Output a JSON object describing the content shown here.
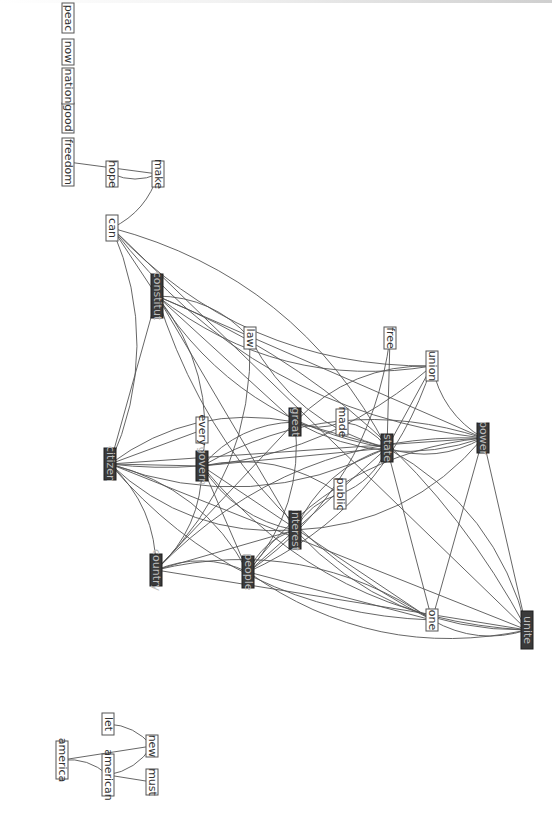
{
  "diagram": {
    "type": "word co-occurrence network",
    "orientation": "rotated-90-clockwise",
    "nodes": [
      {
        "id": "freedom",
        "label": "freedom",
        "style": "light"
      },
      {
        "id": "good",
        "label": "good",
        "style": "light"
      },
      {
        "id": "nation",
        "label": "nation",
        "style": "light"
      },
      {
        "id": "now",
        "label": "now",
        "style": "light"
      },
      {
        "id": "peace",
        "label": "peac",
        "style": "light"
      },
      {
        "id": "hope",
        "label": "hope",
        "style": "light"
      },
      {
        "id": "make",
        "label": "make",
        "style": "light"
      },
      {
        "id": "can",
        "label": "can",
        "style": "light"
      },
      {
        "id": "constitut",
        "label": "constitut",
        "style": "dark"
      },
      {
        "id": "law",
        "label": "law",
        "style": "light"
      },
      {
        "id": "free",
        "label": "free",
        "style": "light"
      },
      {
        "id": "union",
        "label": "union",
        "style": "light"
      },
      {
        "id": "citizen",
        "label": "citizen",
        "style": "dark"
      },
      {
        "id": "every",
        "label": "every",
        "style": "light"
      },
      {
        "id": "govern",
        "label": "govern",
        "style": "dark"
      },
      {
        "id": "great",
        "label": "great",
        "style": "dark"
      },
      {
        "id": "made",
        "label": "made",
        "style": "light"
      },
      {
        "id": "state",
        "label": "state",
        "style": "dark"
      },
      {
        "id": "power",
        "label": "power",
        "style": "dark"
      },
      {
        "id": "public",
        "label": "public",
        "style": "light"
      },
      {
        "id": "interest",
        "label": "interest",
        "style": "dark"
      },
      {
        "id": "country",
        "label": "country",
        "style": "dark"
      },
      {
        "id": "people",
        "label": "people",
        "style": "dark"
      },
      {
        "id": "one",
        "label": "one",
        "style": "light"
      },
      {
        "id": "unite",
        "label": "unite",
        "style": "dark"
      },
      {
        "id": "let",
        "label": "let",
        "style": "light"
      },
      {
        "id": "america",
        "label": "america",
        "style": "light"
      },
      {
        "id": "american",
        "label": "american",
        "style": "light"
      },
      {
        "id": "new",
        "label": "new",
        "style": "light"
      },
      {
        "id": "must",
        "label": "must",
        "style": "light"
      }
    ],
    "edges": [
      [
        "freedom",
        "make"
      ],
      [
        "hope",
        "make"
      ],
      [
        "make",
        "can"
      ],
      [
        "can",
        "constitut"
      ],
      [
        "can",
        "state"
      ],
      [
        "can",
        "power"
      ],
      [
        "can",
        "unite"
      ],
      [
        "can",
        "union"
      ],
      [
        "can",
        "citizen"
      ],
      [
        "constitut",
        "citizen"
      ],
      [
        "constitut",
        "govern"
      ],
      [
        "constitut",
        "state"
      ],
      [
        "constitut",
        "power"
      ],
      [
        "constitut",
        "union"
      ],
      [
        "constitut",
        "unite"
      ],
      [
        "constitut",
        "interest"
      ],
      [
        "constitut",
        "law"
      ],
      [
        "constitut",
        "one"
      ],
      [
        "constitut",
        "great"
      ],
      [
        "law",
        "state"
      ],
      [
        "law",
        "country"
      ],
      [
        "free",
        "state"
      ],
      [
        "free",
        "people"
      ],
      [
        "union",
        "great"
      ],
      [
        "union",
        "state"
      ],
      [
        "union",
        "power"
      ],
      [
        "union",
        "people"
      ],
      [
        "citizen",
        "govern"
      ],
      [
        "citizen",
        "great"
      ],
      [
        "citizen",
        "state"
      ],
      [
        "citizen",
        "power"
      ],
      [
        "citizen",
        "interest"
      ],
      [
        "citizen",
        "country"
      ],
      [
        "citizen",
        "unite"
      ],
      [
        "citizen",
        "people"
      ],
      [
        "citizen",
        "one"
      ],
      [
        "citizen",
        "every"
      ],
      [
        "citizen",
        "union"
      ],
      [
        "govern",
        "great"
      ],
      [
        "govern",
        "state"
      ],
      [
        "govern",
        "power"
      ],
      [
        "govern",
        "interest"
      ],
      [
        "govern",
        "people"
      ],
      [
        "govern",
        "unite"
      ],
      [
        "govern",
        "public"
      ],
      [
        "govern",
        "one"
      ],
      [
        "govern",
        "country"
      ],
      [
        "great",
        "made"
      ],
      [
        "great",
        "state"
      ],
      [
        "great",
        "power"
      ],
      [
        "great",
        "people"
      ],
      [
        "great",
        "country"
      ],
      [
        "made",
        "state"
      ],
      [
        "state",
        "power"
      ],
      [
        "state",
        "people"
      ],
      [
        "state",
        "interest"
      ],
      [
        "state",
        "public"
      ],
      [
        "state",
        "one"
      ],
      [
        "state",
        "unite"
      ],
      [
        "power",
        "people"
      ],
      [
        "power",
        "unite"
      ],
      [
        "power",
        "country"
      ],
      [
        "power",
        "interest"
      ],
      [
        "power",
        "one"
      ],
      [
        "interest",
        "public"
      ],
      [
        "interest",
        "people"
      ],
      [
        "interest",
        "country"
      ],
      [
        "interest",
        "unite"
      ],
      [
        "country",
        "people"
      ],
      [
        "country",
        "unite"
      ],
      [
        "country",
        "one"
      ],
      [
        "people",
        "unite"
      ],
      [
        "people",
        "one"
      ],
      [
        "one",
        "unite"
      ],
      [
        "let",
        "new"
      ],
      [
        "america",
        "new"
      ],
      [
        "america",
        "american"
      ],
      [
        "american",
        "new"
      ],
      [
        "american",
        "must"
      ]
    ]
  }
}
